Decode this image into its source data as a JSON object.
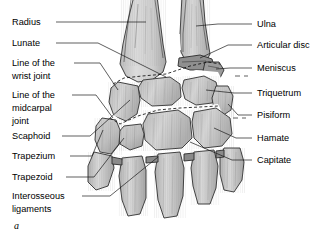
{
  "figure": {
    "panel_letter": "a",
    "palette": {
      "background": "#ffffff",
      "bone_fill_light": "#d8d8d8",
      "bone_fill_mid": "#c4c4c4",
      "bone_fill_dark": "#ababab",
      "outline": "#2b2b2b",
      "leader": "#1a1a1a",
      "text": "#000000"
    }
  },
  "labels_left": [
    {
      "id": "radius",
      "text": "Radius",
      "x": 12,
      "y": 25
    },
    {
      "id": "lunate",
      "text": "Lunate",
      "x": 12,
      "y": 46
    },
    {
      "id": "wrist-joint-line-1",
      "text": "Line of  the",
      "x": 12,
      "y": 68
    },
    {
      "id": "wrist-joint-line-2",
      "text": "wrist joint",
      "x": 12,
      "y": 79
    },
    {
      "id": "midcarpal-joint-line-1",
      "text": "Line of the",
      "x": 12,
      "y": 99
    },
    {
      "id": "midcarpal-joint-line-2",
      "text": "midcarpal",
      "x": 12,
      "y": 110
    },
    {
      "id": "midcarpal-joint-line-3",
      "text": "joint",
      "x": 12,
      "y": 121
    },
    {
      "id": "scaphoid",
      "text": "Scaphoid",
      "x": 12,
      "y": 140
    },
    {
      "id": "trapezium",
      "text": "Trapezium",
      "x": 12,
      "y": 159
    },
    {
      "id": "trapezoid",
      "text": "Trapezoid",
      "x": 12,
      "y": 180
    },
    {
      "id": "interosseous-1",
      "text": "Interosseous",
      "x": 12,
      "y": 199
    },
    {
      "id": "interosseous-2",
      "text": "ligaments",
      "x": 12,
      "y": 211
    }
  ],
  "labels_right": [
    {
      "id": "ulna",
      "text": "Ulna",
      "x": 257,
      "y": 27
    },
    {
      "id": "articular-disc",
      "text": "Articular disc",
      "x": 257,
      "y": 48
    },
    {
      "id": "meniscus",
      "text": "Meniscus",
      "x": 257,
      "y": 71
    },
    {
      "id": "triquetrum",
      "text": "Triquetrum",
      "x": 257,
      "y": 96
    },
    {
      "id": "pisiform",
      "text": "Pisiform",
      "x": 257,
      "y": 118
    },
    {
      "id": "hamate",
      "text": "Hamate",
      "x": 257,
      "y": 141
    },
    {
      "id": "capitate",
      "text": "Capitate",
      "x": 257,
      "y": 163
    }
  ],
  "structures": [
    "radius",
    "ulna",
    "articular disc",
    "meniscus",
    "lunate",
    "scaphoid",
    "triquetrum",
    "pisiform",
    "hamate",
    "capitate",
    "trapezium",
    "trapezoid",
    "interosseous ligaments",
    "line of the wrist joint",
    "line of the midcarpal joint"
  ]
}
